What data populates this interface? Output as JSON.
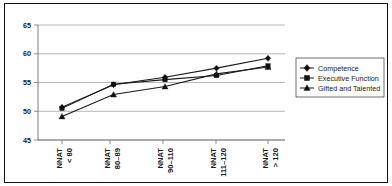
{
  "figure": {
    "frame_color": "#111111",
    "background": "#ffffff"
  },
  "legend": {
    "position": "right",
    "items": [
      {
        "label": "Competence",
        "marker": "diamond",
        "color": "#111111"
      },
      {
        "label": "Executive Function",
        "marker": "square",
        "color": "#111111"
      },
      {
        "label": "Gifted and Talented",
        "marker": "triangle",
        "color": "#111111"
      }
    ]
  },
  "axes": {
    "y_ticks": [
      "45",
      "50",
      "55",
      "60",
      "65"
    ],
    "x_ticks": [
      {
        "line1": "NNAT",
        "line2": "< 80"
      },
      {
        "line1": "NNAT",
        "line2": "80–89"
      },
      {
        "line1": "NNAT",
        "line2": "90–110"
      },
      {
        "line1": "NNAT",
        "line2": "111–120"
      },
      {
        "line1": "NNAT",
        "line2": "> 120"
      }
    ]
  },
  "chart_data": {
    "type": "line",
    "title": "",
    "subtitle": "",
    "xlabel": "",
    "ylabel": "",
    "categories": [
      "NNAT < 80",
      "NNAT 80–89",
      "NNAT 90–110",
      "NNAT 111–120",
      "NNAT > 120"
    ],
    "series": [
      {
        "name": "Competence",
        "marker": "diamond",
        "values": [
          50.7,
          54.6,
          55.9,
          57.5,
          59.2
        ]
      },
      {
        "name": "Executive Function",
        "marker": "square",
        "values": [
          50.5,
          54.7,
          55.5,
          56.2,
          57.9
        ]
      },
      {
        "name": "Gifted and Talented",
        "marker": "triangle",
        "values": [
          49.1,
          52.9,
          54.3,
          56.5,
          57.7
        ]
      }
    ],
    "ylim": [
      45,
      65
    ],
    "ytick_values": [
      45,
      50,
      55,
      60,
      65
    ],
    "grid": true,
    "grid_axis": "y",
    "legend_position": "right"
  }
}
